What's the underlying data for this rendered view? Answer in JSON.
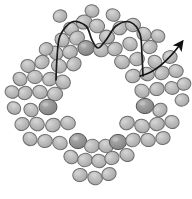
{
  "figure": {
    "title": "Ring of particles with wavy filament and direction arrow",
    "width": 192,
    "height": 199,
    "background_color": "#ffffff"
  },
  "style": {
    "bead_fill_light": "#b9b9b9",
    "bead_fill_dark": "#8f8f8f",
    "bead_highlight": "#d2d2d2",
    "bead_stroke": "#6e6e6e",
    "bead_stroke_dark": "#555555",
    "filament_color": "#1a1a1a",
    "arrow_color": "#111111",
    "filament_width": 1.7,
    "arrow_width": 1.6
  },
  "chart_data": {
    "type": "scatter",
    "title": "Ring of particles with wavy filament and direction arrow",
    "xlabel": "",
    "ylabel": "",
    "xlim": [
      0,
      192
    ],
    "ylim": [
      0,
      199
    ],
    "grid": false,
    "legend": "none",
    "series": [
      {
        "name": "beads",
        "note": "Each entry: cx, cy, rx, ry, rotation degrees, shade (light|dark)",
        "values": [
          [
            84,
            22,
            8.0,
            7.0,
            -15,
            "light"
          ],
          [
            71,
            29,
            7.5,
            6.6,
            25,
            "light"
          ],
          [
            97,
            26,
            7.6,
            6.8,
            10,
            "light"
          ],
          [
            62,
            40,
            7.4,
            6.6,
            40,
            "light"
          ],
          [
            77,
            38,
            7.6,
            6.8,
            -20,
            "light"
          ],
          [
            107,
            37,
            7.6,
            6.8,
            15,
            "light"
          ],
          [
            120,
            28,
            7.4,
            6.6,
            -30,
            "light"
          ],
          [
            133,
            25,
            7.5,
            6.7,
            5,
            "light"
          ],
          [
            144,
            34,
            7.4,
            6.5,
            35,
            "light"
          ],
          [
            56,
            53,
            7.2,
            6.4,
            50,
            "light"
          ],
          [
            70,
            52,
            7.4,
            6.6,
            -10,
            "light"
          ],
          [
            86,
            48,
            8.2,
            7.4,
            0,
            "dark"
          ],
          [
            101,
            50,
            7.6,
            6.8,
            12,
            "light"
          ],
          [
            115,
            49,
            7.4,
            6.6,
            -18,
            "light"
          ],
          [
            130,
            44,
            7.4,
            6.6,
            28,
            "light"
          ],
          [
            150,
            47,
            7.3,
            6.5,
            -25,
            "light"
          ],
          [
            59,
            66,
            7.6,
            6.8,
            20,
            "light"
          ],
          [
            74,
            64,
            7.4,
            6.6,
            -35,
            "light"
          ],
          [
            122,
            62,
            7.5,
            6.7,
            22,
            "light"
          ],
          [
            137,
            59,
            7.4,
            6.6,
            -15,
            "light"
          ],
          [
            155,
            62,
            7.3,
            6.5,
            40,
            "light"
          ],
          [
            170,
            57,
            7.2,
            6.4,
            -5,
            "light"
          ],
          [
            28,
            66,
            7.2,
            6.4,
            15,
            "light"
          ],
          [
            42,
            62,
            7.3,
            6.5,
            -28,
            "light"
          ],
          [
            20,
            79,
            7.2,
            6.4,
            35,
            "light"
          ],
          [
            35,
            77,
            7.4,
            6.6,
            0,
            "light"
          ],
          [
            50,
            79,
            7.5,
            6.7,
            -20,
            "light"
          ],
          [
            63,
            82,
            7.6,
            6.8,
            30,
            "light"
          ],
          [
            133,
            76,
            7.5,
            6.7,
            -12,
            "light"
          ],
          [
            147,
            74,
            7.4,
            6.6,
            25,
            "light"
          ],
          [
            162,
            73,
            7.3,
            6.5,
            -30,
            "light"
          ],
          [
            176,
            71,
            7.2,
            6.4,
            10,
            "light"
          ],
          [
            25,
            93,
            7.3,
            6.5,
            -22,
            "light"
          ],
          [
            40,
            92,
            7.4,
            6.6,
            18,
            "light"
          ],
          [
            55,
            94,
            7.6,
            6.8,
            -8,
            "light"
          ],
          [
            48,
            107,
            9.0,
            7.8,
            0,
            "dark"
          ],
          [
            142,
            91,
            7.4,
            6.6,
            32,
            "light"
          ],
          [
            157,
            89,
            7.3,
            6.5,
            -18,
            "light"
          ],
          [
            172,
            88,
            7.2,
            6.4,
            8,
            "light"
          ],
          [
            145,
            106,
            8.8,
            7.6,
            0,
            "dark"
          ],
          [
            31,
            110,
            7.3,
            6.5,
            28,
            "light"
          ],
          [
            22,
            124,
            7.2,
            6.4,
            -15,
            "light"
          ],
          [
            37,
            124,
            7.4,
            6.6,
            20,
            "light"
          ],
          [
            53,
            125,
            7.5,
            6.7,
            -25,
            "light"
          ],
          [
            68,
            123,
            7.4,
            6.6,
            12,
            "light"
          ],
          [
            160,
            110,
            7.3,
            6.5,
            -32,
            "light"
          ],
          [
            172,
            122,
            7.2,
            6.4,
            15,
            "light"
          ],
          [
            157,
            124,
            7.4,
            6.6,
            -10,
            "light"
          ],
          [
            142,
            126,
            7.5,
            6.7,
            25,
            "light"
          ],
          [
            127,
            123,
            7.4,
            6.6,
            -20,
            "light"
          ],
          [
            30,
            139,
            7.2,
            6.4,
            35,
            "light"
          ],
          [
            45,
            141,
            7.3,
            6.5,
            -5,
            "light"
          ],
          [
            60,
            143,
            7.4,
            6.6,
            22,
            "light"
          ],
          [
            78,
            141,
            8.6,
            7.6,
            0,
            "dark"
          ],
          [
            92,
            146,
            7.5,
            6.7,
            -18,
            "light"
          ],
          [
            106,
            146,
            7.4,
            6.6,
            15,
            "light"
          ],
          [
            118,
            142,
            8.6,
            7.6,
            0,
            "dark"
          ],
          [
            133,
            140,
            7.4,
            6.6,
            -28,
            "light"
          ],
          [
            148,
            140,
            7.3,
            6.5,
            18,
            "light"
          ],
          [
            163,
            138,
            7.2,
            6.4,
            -12,
            "light"
          ],
          [
            71,
            157,
            7.3,
            6.5,
            28,
            "light"
          ],
          [
            85,
            160,
            7.4,
            6.6,
            -15,
            "light"
          ],
          [
            99,
            161,
            7.4,
            6.6,
            10,
            "light"
          ],
          [
            112,
            158,
            7.3,
            6.5,
            -25,
            "light"
          ],
          [
            127,
            155,
            7.2,
            6.4,
            20,
            "light"
          ],
          [
            80,
            175,
            7.3,
            6.5,
            -8,
            "light"
          ],
          [
            95,
            178,
            7.4,
            6.6,
            25,
            "light"
          ],
          [
            109,
            174,
            7.2,
            6.4,
            -20,
            "light"
          ],
          [
            92,
            11,
            7.0,
            6.2,
            12,
            "light"
          ],
          [
            60,
            16,
            6.9,
            6.1,
            -22,
            "light"
          ],
          [
            113,
            15,
            7.0,
            6.2,
            18,
            "light"
          ],
          [
            46,
            49,
            7.0,
            6.2,
            -30,
            "light"
          ],
          [
            158,
            36,
            7.0,
            6.2,
            22,
            "light"
          ],
          [
            12,
            92,
            7.0,
            6.2,
            14,
            "light"
          ],
          [
            182,
            100,
            6.9,
            6.1,
            -16,
            "light"
          ],
          [
            14,
            108,
            6.9,
            6.1,
            30,
            "light"
          ],
          [
            184,
            84,
            6.9,
            6.1,
            -12,
            "light"
          ]
        ]
      }
    ],
    "annotations": [
      {
        "name": "wavy-filament",
        "type": "path",
        "description": "Dark sinusoidal double-hump filament crossing the top of the ring",
        "points": [
          [
            56,
            80
          ],
          [
            57,
            58
          ],
          [
            60,
            36
          ],
          [
            72,
            22
          ],
          [
            86,
            26
          ],
          [
            92,
            40
          ],
          [
            98,
            48
          ],
          [
            106,
            40
          ],
          [
            116,
            26
          ],
          [
            130,
            22
          ],
          [
            140,
            34
          ],
          [
            142,
            56
          ],
          [
            143,
            76
          ]
        ]
      },
      {
        "name": "direction-arrow",
        "type": "arrow",
        "description": "Curved arrow emerging from the ring at the upper right, pointing up and to the right",
        "tail": [
          140,
          76
        ],
        "control": [
          160,
          72
        ],
        "tip": [
          182,
          42
        ],
        "head_size": 11
      }
    ]
  }
}
